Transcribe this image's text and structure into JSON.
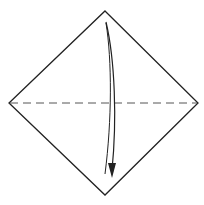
{
  "diagram": {
    "type": "origami-fold-step",
    "colors": {
      "background": "#ffffff",
      "outline": "#222222",
      "fold_line": "#555555",
      "arrow": "#222222"
    },
    "paper": {
      "shape": "diamond",
      "vertices": {
        "top": [
          105,
          11
        ],
        "right": [
          198,
          103
        ],
        "bottom": [
          105,
          195
        ],
        "left": [
          9,
          103
        ]
      }
    },
    "fold_line": {
      "style": "dashed",
      "kind": "valley-fold",
      "from": [
        9,
        103
      ],
      "to": [
        198,
        103
      ]
    },
    "arrow": {
      "direction": "down",
      "meaning": "fold top corner down to bottom",
      "start": [
        106,
        22
      ],
      "end": [
        112,
        178
      ]
    }
  }
}
